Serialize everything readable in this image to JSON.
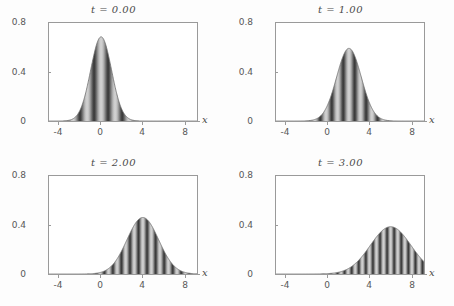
{
  "figure": {
    "background_color": "#fdfdfd",
    "frame_color": "#9a9a9a",
    "text_color": "#4a4a4a",
    "layout": "2x2 grid of plots"
  },
  "chart_data": {
    "type": "area",
    "title": "",
    "xlabel": "x",
    "ylabel": "",
    "xlim": [
      -5,
      9.2
    ],
    "ylim": [
      0,
      0.85
    ],
    "xticks": [
      -4,
      0,
      4,
      8
    ],
    "xticklabels": [
      "-4",
      "0",
      "4",
      "8"
    ],
    "yticks": [
      0,
      0.4,
      0.8
    ],
    "yticklabels": [
      "0",
      "0.4",
      "0.8"
    ],
    "grid": false,
    "legend": null,
    "panels": [
      {
        "id": "panel-t0",
        "title": "t = 0.00",
        "time_value": "0.00",
        "center": 0.0,
        "peak_height": 0.73,
        "width_sigma": 1.0,
        "stripe_wavelength": 1.35,
        "stripe_count": 5
      },
      {
        "id": "panel-t1",
        "title": "t = 1.00",
        "time_value": "1.00",
        "center": 2.0,
        "peak_height": 0.63,
        "width_sigma": 1.18,
        "stripe_wavelength": 1.1,
        "stripe_count": 7
      },
      {
        "id": "panel-t2",
        "title": "t = 2.00",
        "time_value": "2.00",
        "center": 4.0,
        "peak_height": 0.49,
        "width_sigma": 1.52,
        "stripe_wavelength": 0.82,
        "stripe_count": 11
      },
      {
        "id": "panel-t3",
        "title": "t = 3.00",
        "time_value": "3.00",
        "center": 6.0,
        "peak_height": 0.41,
        "width_sigma": 1.95,
        "stripe_wavelength": 0.68,
        "stripe_count": 15
      }
    ]
  }
}
